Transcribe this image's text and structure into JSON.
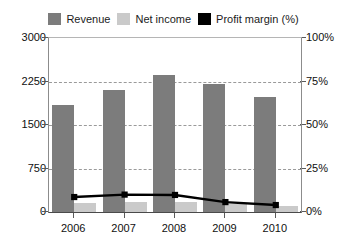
{
  "chart_data": {
    "type": "bar",
    "title": "",
    "subtitle": "",
    "xlabel": "",
    "ylabel": "",
    "categories": [
      "2006",
      "2007",
      "2008",
      "2009",
      "2010"
    ],
    "series": [
      {
        "name": "Revenue",
        "type": "bar",
        "axis": "left",
        "color": "#7c7c7c",
        "values": [
          1840,
          2100,
          2360,
          2210,
          1980
        ]
      },
      {
        "name": "Net income",
        "type": "bar",
        "axis": "left",
        "color": "#cacaca",
        "values": [
          160,
          170,
          165,
          130,
          110
        ]
      },
      {
        "name": "Profit margin (%)",
        "type": "line",
        "axis": "right",
        "color": "#000000",
        "values": [
          8.6,
          10.0,
          9.8,
          5.7,
          4.0
        ]
      }
    ],
    "left_axis": {
      "min": 0,
      "max": 3000,
      "ticks": [
        0,
        750,
        1500,
        2250,
        3000
      ],
      "tick_labels": [
        "0",
        "750",
        "1500",
        "2250",
        "3000"
      ]
    },
    "right_axis": {
      "min": 0,
      "max": 100,
      "ticks": [
        0,
        25,
        50,
        75,
        100
      ],
      "tick_labels": [
        "0%",
        "25%",
        "50%",
        "75%",
        "100%"
      ]
    },
    "grid": true,
    "legend_position": "top"
  },
  "legend": {
    "items": [
      {
        "label": "Revenue",
        "color": "#7c7c7c"
      },
      {
        "label": "Net income",
        "color": "#cacaca"
      },
      {
        "label": "Profit margin (%)",
        "color": "#000000"
      }
    ]
  }
}
